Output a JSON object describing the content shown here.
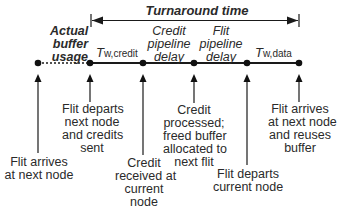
{
  "diagram": {
    "turnaround_label": "Turnaround time",
    "actual_buffer_usage": [
      "Actual",
      "buffer",
      "usage"
    ],
    "segments": [
      {
        "id": "t_w_credit",
        "main": "T",
        "sub": "w,credit"
      },
      {
        "id": "credit_pipeline",
        "lines": [
          "Credit",
          "pipeline",
          "delay"
        ]
      },
      {
        "id": "flit_pipeline",
        "lines": [
          "Flit",
          "pipeline",
          "delay"
        ]
      },
      {
        "id": "t_w_data",
        "main": "T",
        "sub": "w,data"
      }
    ],
    "events": [
      {
        "lines": [
          "Flit arrives",
          "at next node"
        ]
      },
      {
        "lines": [
          "Flit departs",
          "next node",
          "and credits",
          "sent"
        ]
      },
      {
        "lines": [
          "Credit",
          "received at",
          "current",
          "node"
        ]
      },
      {
        "lines": [
          "Credit",
          "processed;",
          "freed buffer",
          "allocated to",
          "next flit"
        ]
      },
      {
        "lines": [
          "Flit departs",
          "current node"
        ]
      },
      {
        "lines": [
          "Flit arrives",
          "at next node",
          "and reuses",
          "buffer"
        ]
      }
    ],
    "colors": {
      "line": "#1a1a1a",
      "text": "#2a2a2a",
      "background": "#ffffff"
    }
  }
}
